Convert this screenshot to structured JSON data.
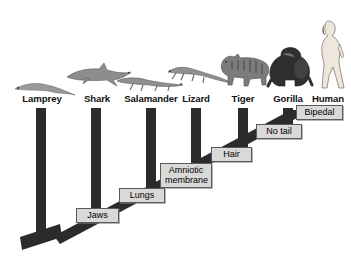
{
  "figure": {
    "type": "cladogram",
    "title": "",
    "background_color": "#ffffff",
    "branch_color": "#2b2b2b",
    "label_box_fill": "#d9d9d9",
    "label_box_border": "#5a5a5a"
  },
  "taxa": [
    {
      "id": "lamprey",
      "label": "Lamprey",
      "x": 42,
      "tip_y": 104,
      "icon": "lamprey-silhouette"
    },
    {
      "id": "shark",
      "label": "Shark",
      "x": 97,
      "tip_y": 104,
      "icon": "shark-silhouette"
    },
    {
      "id": "salamander",
      "label": "Salamander",
      "x": 151,
      "tip_y": 104,
      "icon": "salamander-silhouette"
    },
    {
      "id": "lizard",
      "label": "Lizard",
      "x": 196,
      "tip_y": 104,
      "icon": "lizard-silhouette"
    },
    {
      "id": "tiger",
      "label": "Tiger",
      "x": 243,
      "tip_y": 104,
      "icon": "tiger-silhouette"
    },
    {
      "id": "gorilla",
      "label": "Gorilla",
      "x": 288,
      "tip_y": 104,
      "icon": "gorilla-silhouette"
    },
    {
      "id": "human",
      "label": "Human",
      "x": 328,
      "tip_y": 104,
      "icon": "human-silhouette"
    }
  ],
  "traits": [
    {
      "id": "jaws",
      "label": "Jaws",
      "line1": "Jaws",
      "line2": "",
      "node_x": 60,
      "node_y": 231,
      "box_x": 76,
      "box_y": 208,
      "box_w": 43,
      "box_h": 15
    },
    {
      "id": "lungs",
      "label": "Lungs",
      "line1": "Lungs",
      "line2": "",
      "node_x": 97,
      "node_y": 205,
      "box_x": 119,
      "box_y": 188,
      "box_w": 46,
      "box_h": 15
    },
    {
      "id": "amniotic-membrane",
      "label": "Amniotic membrane",
      "line1": "Amniotic",
      "line2": "membrane",
      "node_x": 151,
      "node_y": 182,
      "box_x": 160,
      "box_y": 163,
      "box_w": 52,
      "box_h": 25
    },
    {
      "id": "hair",
      "label": "Hair",
      "line1": "Hair",
      "line2": "",
      "node_x": 196,
      "node_y": 159,
      "box_x": 211,
      "box_y": 147,
      "box_w": 41,
      "box_h": 15
    },
    {
      "id": "no-tail",
      "label": "No tail",
      "line1": "No tail",
      "line2": "",
      "node_x": 243,
      "node_y": 137,
      "box_x": 256,
      "box_y": 124,
      "box_w": 46,
      "box_h": 15
    },
    {
      "id": "bipedal",
      "label": "Bipedal",
      "line1": "Bipedal",
      "line2": "",
      "node_x": 288,
      "node_y": 117,
      "box_x": 296,
      "box_y": 105,
      "box_w": 47,
      "box_h": 15
    }
  ],
  "root": {
    "stub_x_start": 22,
    "stub_y": 243,
    "node_x": 60,
    "node_y": 231
  },
  "legend_note": ""
}
